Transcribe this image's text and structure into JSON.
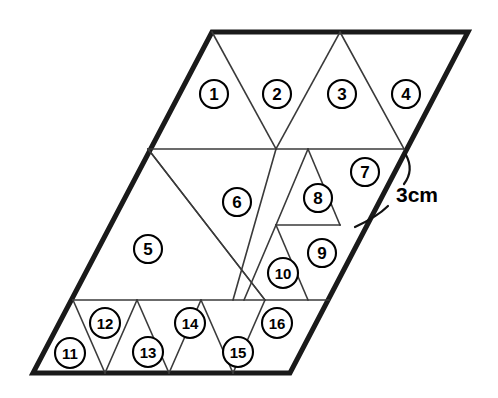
{
  "figure": {
    "kind": "geometry-diagram",
    "shape_name": "parallelogram",
    "background_color": "#ffffff",
    "outline_color": "#1a1a1a",
    "gridline_color": "#3a3a3a",
    "label_text_color": "#000000",
    "label_circle_fill": "#ffffff",
    "outline_points": "212,32 468,32 290,373 33,373",
    "gridlines": [
      {
        "name": "upper-horizontal",
        "d": "M 148,149 L 404,149"
      },
      {
        "name": "lower-horizontal",
        "d": "M 73,300 L 329,300"
      },
      {
        "name": "short-horizontal-8-9",
        "d": "M 276,225 L 340,225"
      },
      {
        "name": "edge-1-2-right",
        "d": "M 212,32 L 276,149"
      },
      {
        "name": "edge-2-3-left",
        "d": "M 340,32 L 276,149"
      },
      {
        "name": "edge-3-4-right",
        "d": "M 340,32 L 404,149"
      },
      {
        "name": "triangle-5-right",
        "d": "M 148,149 L 265,300"
      },
      {
        "name": "triangle-6-left",
        "d": "M 148,149 L 265,300"
      },
      {
        "name": "triangle-6-right",
        "d": "M 276,149 L 233,300"
      },
      {
        "name": "triangle-8-left",
        "d": "M 308,149 L 276,225"
      },
      {
        "name": "triangle-8-right",
        "d": "M 308,149 L 340,225"
      },
      {
        "name": "triangle-10-left",
        "d": "M 276,225 L 244,300"
      },
      {
        "name": "triangle-9-left",
        "d": "M 276,225 L 308,300"
      },
      {
        "name": "bottom-11-12",
        "d": "M 73,300 L 105,373"
      },
      {
        "name": "bottom-12-13",
        "d": "M 137,300 L 105,373"
      },
      {
        "name": "bottom-13-14",
        "d": "M 137,300 L 169,373"
      },
      {
        "name": "bottom-14-15",
        "d": "M 201,300 L 169,373"
      },
      {
        "name": "bottom-15-16",
        "d": "M 201,300 L 233,373"
      },
      {
        "name": "bottom-16-right",
        "d": "M 265,300 L 233,373"
      }
    ],
    "triangle_labels": [
      {
        "id": 1,
        "text": "1",
        "cx": 214,
        "cy": 94,
        "r": 14,
        "font_size": 17
      },
      {
        "id": 2,
        "text": "2",
        "cx": 277,
        "cy": 94,
        "r": 14,
        "font_size": 17
      },
      {
        "id": 3,
        "text": "3",
        "cx": 342,
        "cy": 94,
        "r": 14,
        "font_size": 17
      },
      {
        "id": 4,
        "text": "4",
        "cx": 406,
        "cy": 94,
        "r": 14,
        "font_size": 17
      },
      {
        "id": 5,
        "text": "5",
        "cx": 148,
        "cy": 249,
        "r": 14,
        "font_size": 17
      },
      {
        "id": 6,
        "text": "6",
        "cx": 237,
        "cy": 202,
        "r": 14,
        "font_size": 17
      },
      {
        "id": 7,
        "text": "7",
        "cx": 365,
        "cy": 172,
        "r": 14,
        "font_size": 17
      },
      {
        "id": 8,
        "text": "8",
        "cx": 318,
        "cy": 198,
        "r": 14,
        "font_size": 17
      },
      {
        "id": 9,
        "text": "9",
        "cx": 322,
        "cy": 253,
        "r": 14,
        "font_size": 17
      },
      {
        "id": 10,
        "text": "10",
        "cx": 283,
        "cy": 273,
        "r": 15,
        "font_size": 15
      },
      {
        "id": 11,
        "text": "11",
        "cx": 70,
        "cy": 353,
        "r": 15,
        "font_size": 15
      },
      {
        "id": 12,
        "text": "12",
        "cx": 105,
        "cy": 323,
        "r": 15,
        "font_size": 15
      },
      {
        "id": 13,
        "text": "13",
        "cx": 148,
        "cy": 352,
        "r": 15,
        "font_size": 15
      },
      {
        "id": 14,
        "text": "14",
        "cx": 190,
        "cy": 323,
        "r": 15,
        "font_size": 15
      },
      {
        "id": 15,
        "text": "15",
        "cx": 238,
        "cy": 352,
        "r": 15,
        "font_size": 15
      },
      {
        "id": 16,
        "text": "16",
        "cx": 277,
        "cy": 323,
        "r": 15,
        "font_size": 15
      }
    ],
    "dimension": {
      "label": "3cm",
      "label_x": 396,
      "label_y": 194,
      "leader_upper": "M 406,155 C 412,166 410,176 404,184",
      "leader_lower": "M 388,206 C 380,214 368,221 355,227"
    }
  }
}
